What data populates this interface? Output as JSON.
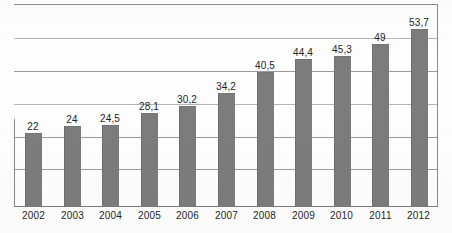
{
  "chart_data": {
    "type": "bar",
    "title": "",
    "subtitle": "",
    "xlabel": "",
    "ylabel": "",
    "categories": [
      "2002",
      "2003",
      "2004",
      "2005",
      "2006",
      "2007",
      "2008",
      "2009",
      "2010",
      "2011",
      "2012"
    ],
    "values": [
      22,
      24,
      24.5,
      28.1,
      30.2,
      34.2,
      40.5,
      44.4,
      45.3,
      49,
      53.7
    ],
    "value_labels": [
      "22",
      "24",
      "24,5",
      "28,1",
      "30,2",
      "34,2",
      "40,5",
      "44,4",
      "45,3",
      "49",
      "53,7"
    ],
    "decimal_separator": ",",
    "ylim": [
      0,
      61.5
    ],
    "gridlines": [
      0,
      10,
      20,
      30,
      40,
      50,
      60
    ],
    "grid": true,
    "y_axis_tick_labels_shown": false,
    "legend": null,
    "legend_position": "none",
    "bar_color": "#7c7c7c",
    "grid_color": "#9a9a9a",
    "axis_color": "#7a7a7a",
    "label_color": "#232323",
    "background": "#fefefe",
    "series": [
      {
        "name": "series-1",
        "values": [
          22,
          24,
          24.5,
          28.1,
          30.2,
          34.2,
          40.5,
          44.4,
          45.3,
          49,
          53.7
        ]
      }
    ]
  }
}
